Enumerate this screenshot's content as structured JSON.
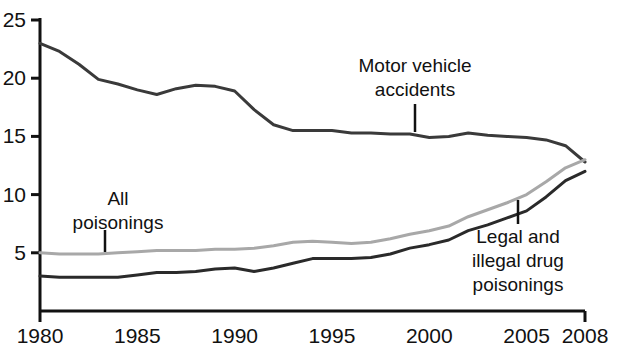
{
  "chart_data": {
    "type": "line",
    "title": "",
    "subtitle": "",
    "xlabel": "",
    "ylabel": "",
    "xlim": [
      1980,
      2008
    ],
    "ylim": [
      0,
      25
    ],
    "grid": false,
    "legend_position": "none",
    "x_ticks": [
      "1980",
      "1985",
      "1990",
      "1995",
      "2000",
      "2005",
      "2008"
    ],
    "x_tick_values": [
      1980,
      1985,
      1990,
      1995,
      2000,
      2005,
      2008
    ],
    "y_ticks": [
      "5",
      "10",
      "15",
      "20",
      "25"
    ],
    "y_tick_values": [
      5,
      10,
      15,
      20,
      25
    ],
    "x": [
      1980,
      1981,
      1982,
      1983,
      1984,
      1985,
      1986,
      1987,
      1988,
      1989,
      1990,
      1991,
      1992,
      1993,
      1994,
      1995,
      1996,
      1997,
      1998,
      1999,
      2000,
      2001,
      2002,
      2003,
      2004,
      2005,
      2006,
      2007,
      2008
    ],
    "series": [
      {
        "name": "Motor vehicle accidents",
        "color": "#3a3a3a",
        "width": 3,
        "values": [
          23.0,
          22.3,
          21.2,
          19.9,
          19.5,
          19.0,
          18.6,
          19.1,
          19.4,
          19.3,
          18.9,
          17.3,
          16.0,
          15.5,
          15.5,
          15.5,
          15.3,
          15.3,
          15.2,
          15.2,
          14.9,
          15.0,
          15.3,
          15.1,
          15.0,
          14.9,
          14.7,
          14.2,
          12.8
        ]
      },
      {
        "name": "All poisonings",
        "color": "#a8a8a8",
        "width": 3,
        "values": [
          5.0,
          4.9,
          4.9,
          4.9,
          5.0,
          5.1,
          5.2,
          5.2,
          5.2,
          5.3,
          5.3,
          5.4,
          5.6,
          5.9,
          6.0,
          5.9,
          5.8,
          5.9,
          6.2,
          6.6,
          6.9,
          7.3,
          8.1,
          8.7,
          9.3,
          10.0,
          11.1,
          12.3,
          13.0
        ]
      },
      {
        "name": "Legal and illegal drug poisonings",
        "color": "#2a2a2a",
        "width": 3,
        "values": [
          3.0,
          2.9,
          2.9,
          2.9,
          2.9,
          3.1,
          3.3,
          3.3,
          3.4,
          3.6,
          3.7,
          3.4,
          3.7,
          4.1,
          4.5,
          4.5,
          4.5,
          4.6,
          4.9,
          5.4,
          5.7,
          6.1,
          6.9,
          7.4,
          8.0,
          8.6,
          9.8,
          11.2,
          12.0
        ]
      }
    ],
    "annotations": [
      {
        "id": "motor-vehicle-accidents",
        "lines": [
          "Motor vehicle",
          "accidents"
        ],
        "text_x": 415,
        "text_y": 72,
        "anchor": "middle",
        "leader": {
          "x1": 415,
          "y1": 104,
          "x2": 415,
          "y2": 132
        }
      },
      {
        "id": "all-poisonings",
        "lines": [
          "All",
          "poisonings"
        ],
        "text_x": 118,
        "text_y": 205,
        "anchor": "middle",
        "leader": {
          "x1": 105,
          "y1": 230,
          "x2": 105,
          "y2": 252
        }
      },
      {
        "id": "legal-and-illegal-drug-poisonings",
        "lines": [
          "Legal and",
          "illegal drug",
          "poisonings"
        ],
        "text_x": 518,
        "text_y": 243,
        "anchor": "middle",
        "leader": {
          "x1": 518,
          "y1": 200,
          "x2": 518,
          "y2": 224
        }
      }
    ]
  },
  "axis": {
    "axis_color": "#111111",
    "x_origin_px": 40,
    "x_end_px": 585,
    "y_zero_px": 311,
    "y_top_px": 20
  }
}
